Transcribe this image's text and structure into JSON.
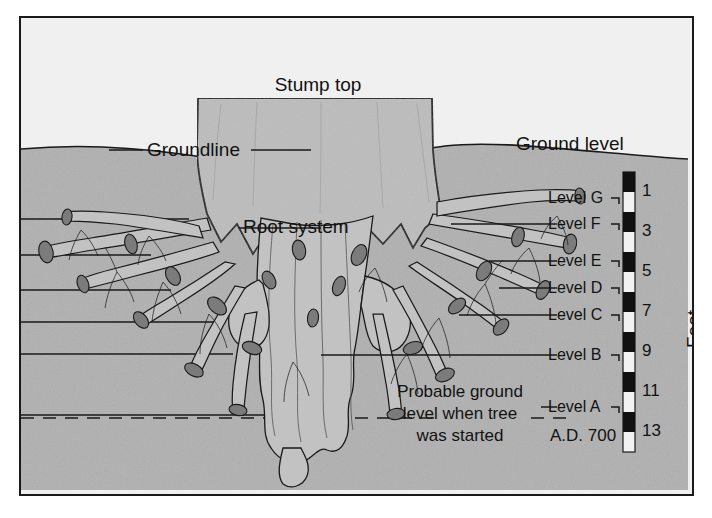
{
  "figure": {
    "title_labels": {
      "stump_top": "Stump top",
      "ground_level": "Ground level",
      "groundline": "Groundline",
      "root_system": "Root system"
    },
    "note": {
      "line1": "Probable ground",
      "line2": "level when tree",
      "line3": "was started",
      "date": "A.D. 700"
    },
    "levels": [
      {
        "label": "Level G",
        "y": 196
      },
      {
        "label": "Level F",
        "y": 222
      },
      {
        "label": "Level E",
        "y": 259
      },
      {
        "label": "Level D",
        "y": 286
      },
      {
        "label": "Level C",
        "y": 313
      },
      {
        "label": "Level B",
        "y": 353
      },
      {
        "label": "Level A",
        "y": 405
      }
    ],
    "scale": {
      "axis_title": "Feet",
      "ticks": [
        "1",
        "3",
        "5",
        "7",
        "9",
        "11",
        "13"
      ],
      "unit": "feet",
      "range_min": 0,
      "range_max": 14
    },
    "colors": {
      "sky": "#f0f0f0",
      "soil": "#b0b0b0",
      "stump": "#bcbcbc",
      "line": "#1a1a1a",
      "root_fill": "#c2c2c2",
      "cut_root": "#7b7b7b",
      "scale_dark": "#111111",
      "scale_light": "#f2f2f2",
      "text": "#121212"
    }
  }
}
